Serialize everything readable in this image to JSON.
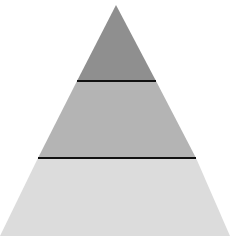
{
  "diagram": {
    "type": "pyramid",
    "tier_count": 3,
    "tiers": [
      {
        "name": "top",
        "label": "",
        "color": "#8f8f8f"
      },
      {
        "name": "middle",
        "label": "",
        "color": "#b4b4b4"
      },
      {
        "name": "bottom",
        "label": "",
        "color": "#dcdcdc"
      }
    ],
    "divider_color": "#111111"
  }
}
